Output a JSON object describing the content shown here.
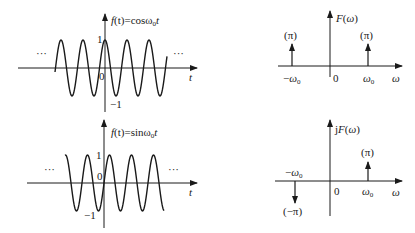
{
  "panels": {
    "cos_time": {
      "function_label_prefix": "f",
      "function_label": "(t)=cosω",
      "function_sub": "0",
      "function_suffix": "t",
      "y_max_label": "1",
      "y_min_label": "−1",
      "origin_label": "0",
      "x_axis_label": "t",
      "ellipsis_left": "···",
      "ellipsis_right": "···"
    },
    "cos_freq": {
      "axis_label": "F(ω)",
      "impulse_left_label": "(π)",
      "impulse_right_label": "(π)",
      "neg_freq_label": "−ω",
      "pos_freq_label": "ω",
      "freq_sub": "0",
      "origin_label": "0",
      "x_axis_label": "ω"
    },
    "sin_time": {
      "function_label_prefix": "f",
      "function_label": "(t)=sinω",
      "function_sub": "0",
      "function_suffix": "t",
      "y_max_label": "1",
      "y_min_label": "−1",
      "origin_label": "0",
      "x_axis_label": "t",
      "ellipsis_left": "···",
      "ellipsis_right": "···"
    },
    "sin_freq": {
      "axis_label": "jF(ω)",
      "impulse_left_label": "(−π)",
      "impulse_right_label": "(π)",
      "neg_freq_label": "−ω",
      "pos_freq_label": "ω",
      "freq_sub": "0",
      "origin_label": "0",
      "x_axis_label": "ω"
    }
  },
  "colors": {
    "stroke": "#1a1a1a",
    "background": "#ffffff"
  }
}
